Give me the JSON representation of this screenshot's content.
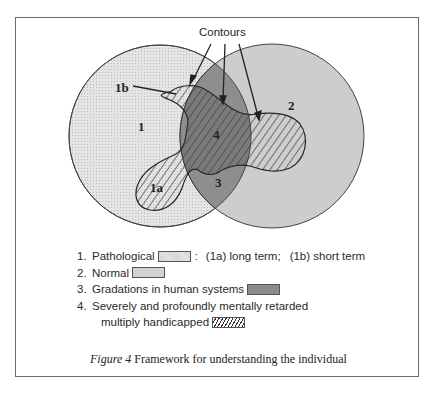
{
  "figure": {
    "caption_prefix": "Figure 4",
    "caption_text": "Framework for understanding the individual"
  },
  "diagram": {
    "contours_label": "Contours",
    "region_labels": {
      "r1": "1",
      "r1a": "1a",
      "r1b": "1b",
      "r2": "2",
      "r3": "3",
      "r4": "4"
    },
    "colors": {
      "pathological": "#dedede",
      "normal": "#c4c4c4",
      "gradations": "#8e8e8e",
      "outline": "#333333"
    }
  },
  "legend": {
    "items": [
      {
        "num": "1.",
        "label": "Pathological",
        "suffix": ":",
        "extra_a": "(1a) long term;",
        "extra_b": "(1b) short term"
      },
      {
        "num": "2.",
        "label": "Normal"
      },
      {
        "num": "3.",
        "label": "Gradations in human systems"
      },
      {
        "num": "4.",
        "label": "Severely and profoundly mentally retarded",
        "label_line2": "multiply handicapped"
      }
    ]
  }
}
